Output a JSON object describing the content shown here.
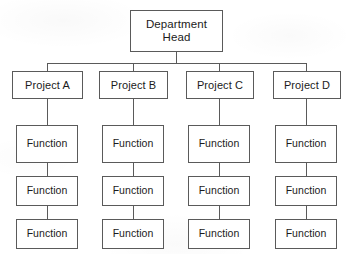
{
  "diagram": {
    "type": "organizational-hierarchy",
    "colors": {
      "background": "#ffffff",
      "box_fill": "#ffffff",
      "box_border": "#5a5a5a",
      "connector": "#5a5a5a",
      "text": "#1b1b1b"
    }
  },
  "root": {
    "id": "department-head",
    "label": "Department\nHead",
    "line1": "Department",
    "line2": "Head",
    "level": 0
  },
  "projects": [
    {
      "id": "project-a",
      "label": "Project A",
      "level": 1,
      "column": 0
    },
    {
      "id": "project-b",
      "label": "Project B",
      "level": 1,
      "column": 1
    },
    {
      "id": "project-c",
      "label": "Project C",
      "level": 1,
      "column": 2
    },
    {
      "id": "project-d",
      "label": "Project D",
      "level": 1,
      "column": 3
    }
  ],
  "functions": {
    "label": "Function",
    "per_project_count": 3,
    "columns": [
      {
        "parent": "project-a",
        "items": [
          {
            "id": "function-a-1",
            "label": "Function",
            "level": 2
          },
          {
            "id": "function-a-2",
            "label": "Function",
            "level": 3
          },
          {
            "id": "function-a-3",
            "label": "Function",
            "level": 4
          }
        ]
      },
      {
        "parent": "project-b",
        "items": [
          {
            "id": "function-b-1",
            "label": "Function",
            "level": 2
          },
          {
            "id": "function-b-2",
            "label": "Function",
            "level": 3
          },
          {
            "id": "function-b-3",
            "label": "Function",
            "level": 4
          }
        ]
      },
      {
        "parent": "project-c",
        "items": [
          {
            "id": "function-c-1",
            "label": "Function",
            "level": 2
          },
          {
            "id": "function-c-2",
            "label": "Function",
            "level": 3
          },
          {
            "id": "function-c-3",
            "label": "Function",
            "level": 4
          }
        ]
      },
      {
        "parent": "project-d",
        "items": [
          {
            "id": "function-d-1",
            "label": "Function",
            "level": 2
          },
          {
            "id": "function-d-2",
            "label": "Function",
            "level": 3
          },
          {
            "id": "function-d-3",
            "label": "Function",
            "level": 4
          }
        ]
      }
    ]
  }
}
